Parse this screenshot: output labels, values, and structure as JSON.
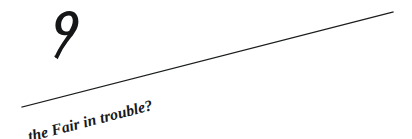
{
  "page": {
    "width": 412,
    "height": 139,
    "background_color": "#ffffff",
    "ink_color": "#16181a"
  },
  "ornament": {
    "name": "stylized-nine-glyph",
    "character": "9",
    "description": "bold calligraphic nine with teardrop loop and sweeping tail",
    "color": "#141617"
  },
  "rule": {
    "name": "diagonal-rule",
    "color": "#1a1c1e",
    "start_x": 22,
    "start_y": 107,
    "end_x": 393,
    "end_y": 12,
    "stroke_width": 1.2
  },
  "caption": {
    "text": "the Fair in trouble?",
    "rotation_deg": -14.4,
    "color": "#16181a"
  }
}
